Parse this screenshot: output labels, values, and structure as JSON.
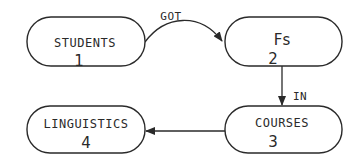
{
  "nodes": [
    {
      "id": "students",
      "label": "STUDENTS",
      "number": "1"
    },
    {
      "id": "fs",
      "label": "Fs",
      "number": "2"
    },
    {
      "id": "courses",
      "label": "COURSES",
      "number": "3"
    },
    {
      "id": "linguistics",
      "label": "LINGUISTICS",
      "number": "4"
    }
  ],
  "edges": [
    {
      "from": "students",
      "to": "fs",
      "label": "GOT"
    },
    {
      "from": "fs",
      "to": "courses",
      "label": "IN"
    },
    {
      "from": "courses",
      "to": "linguistics",
      "label": ""
    }
  ],
  "colors": {
    "stroke": "#2a2a2a",
    "background": "#ffffff"
  }
}
